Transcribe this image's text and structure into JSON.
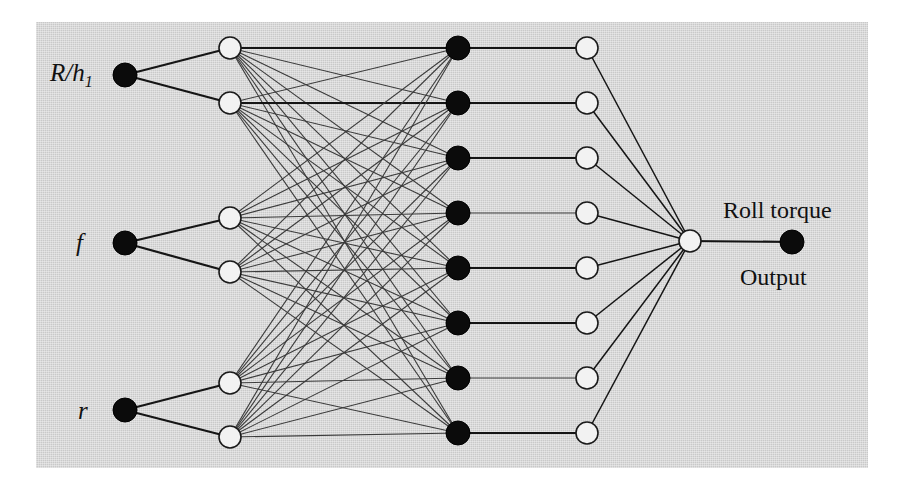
{
  "figure": {
    "kind": "neural-network-architecture-diagram",
    "background_color": "#c9c9c9",
    "page_color": "#ffffff",
    "node_dark_color": "#0b0b0b",
    "node_light_color": "#f2f2f2",
    "edge_color": "#151515",
    "panel": {
      "x": 36,
      "y": 22,
      "width": 832,
      "height": 446
    }
  },
  "labels": {
    "input_1_main": "R/",
    "input_1_var": "h",
    "input_1_sub": "1",
    "input_2": "f",
    "input_3": "r",
    "output_top": "Roll torque",
    "output_bottom": "Output"
  },
  "layers": [
    {
      "name": "input-layer",
      "style": "dark",
      "x": 125,
      "radius": 12,
      "nodes": [
        {
          "id": "in-1",
          "y": 75,
          "label": "R/h1"
        },
        {
          "id": "in-2",
          "y": 243,
          "label": "f"
        },
        {
          "id": "in-3",
          "y": 410,
          "label": "r"
        }
      ]
    },
    {
      "name": "hidden-layer-1",
      "style": "light",
      "x": 230,
      "radius": 11,
      "nodes": [
        {
          "id": "h1-1",
          "y": 48
        },
        {
          "id": "h1-2",
          "y": 103
        },
        {
          "id": "h1-3",
          "y": 218
        },
        {
          "id": "h1-4",
          "y": 272
        },
        {
          "id": "h1-5",
          "y": 383
        },
        {
          "id": "h1-6",
          "y": 437
        }
      ]
    },
    {
      "name": "hidden-layer-2",
      "style": "dark",
      "x": 458,
      "radius": 12,
      "nodes": [
        {
          "id": "h2-1",
          "y": 48
        },
        {
          "id": "h2-2",
          "y": 103
        },
        {
          "id": "h2-3",
          "y": 158
        },
        {
          "id": "h2-4",
          "y": 213
        },
        {
          "id": "h2-5",
          "y": 268
        },
        {
          "id": "h2-6",
          "y": 323
        },
        {
          "id": "h2-7",
          "y": 378
        },
        {
          "id": "h2-8",
          "y": 433
        }
      ]
    },
    {
      "name": "hidden-layer-3",
      "style": "light",
      "x": 587,
      "radius": 11,
      "nodes": [
        {
          "id": "h3-1",
          "y": 48
        },
        {
          "id": "h3-2",
          "y": 103
        },
        {
          "id": "h3-3",
          "y": 158
        },
        {
          "id": "h3-4",
          "y": 213
        },
        {
          "id": "h3-5",
          "y": 268
        },
        {
          "id": "h3-6",
          "y": 323
        },
        {
          "id": "h3-7",
          "y": 378
        },
        {
          "id": "h3-8",
          "y": 433
        }
      ]
    },
    {
      "name": "summation-layer",
      "style": "light",
      "x": 690,
      "radius": 11,
      "nodes": [
        {
          "id": "sum-1",
          "y": 241
        }
      ]
    },
    {
      "name": "output-layer",
      "style": "dark",
      "x": 792,
      "radius": 12,
      "nodes": [
        {
          "id": "out-1",
          "y": 242,
          "label": "Roll torque / Output"
        }
      ]
    }
  ],
  "connections": {
    "input_to_hidden1": [
      [
        "in-1",
        "h1-1"
      ],
      [
        "in-1",
        "h1-2"
      ],
      [
        "in-2",
        "h1-3"
      ],
      [
        "in-2",
        "h1-4"
      ],
      [
        "in-3",
        "h1-5"
      ],
      [
        "in-3",
        "h1-6"
      ]
    ],
    "hidden1_to_hidden2_note": "fully-connected: each of 6 nodes to all 8 nodes",
    "hidden2_to_hidden3_note": "one-to-one horizontal pairing",
    "hidden3_to_sum_note": "all 8 nodes converge to single summation node",
    "sum_to_output_note": "single horizontal link"
  }
}
